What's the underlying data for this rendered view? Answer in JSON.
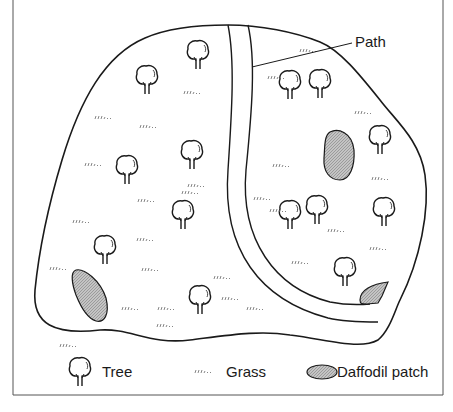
{
  "diagram": {
    "title": "",
    "callouts": [
      {
        "label": "Path",
        "target": "path"
      }
    ],
    "counts": {
      "trees_left": 9,
      "trees_right": 6,
      "daffodil_patches": 3
    },
    "colors": {
      "line": "#1a1a1a",
      "daffodil_fill": "#b9b9b9",
      "background": "#ffffff"
    }
  },
  "labels": {
    "path": "Path"
  },
  "legend": {
    "items": [
      {
        "icon": "tree-icon",
        "label": "Tree"
      },
      {
        "icon": "grass-icon",
        "label": "Grass"
      },
      {
        "icon": "daffodil-patch-icon",
        "label": "Daffodil patch"
      }
    ]
  }
}
